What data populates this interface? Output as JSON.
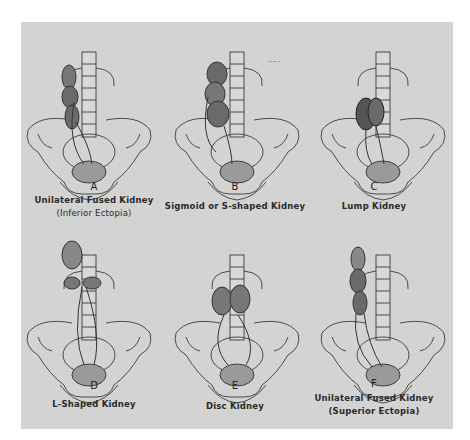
{
  "figure": {
    "background_color": "#d3d3d3",
    "ink_color": "#3a3a3a",
    "kidney_color": "#6a6a6a",
    "panels": [
      {
        "letter": "A",
        "caption_line1": "Unilateral Fused Kidney",
        "caption_line2": "(Inferior Ectopia)"
      },
      {
        "letter": "B",
        "caption_line1": "Sigmoid or S-shaped Kidney",
        "caption_line2": ""
      },
      {
        "letter": "C",
        "caption_line1": "Lump Kidney",
        "caption_line2": ""
      },
      {
        "letter": "D",
        "caption_line1": "L-Shaped Kidney",
        "caption_line2": ""
      },
      {
        "letter": "E",
        "caption_line1": "Disc Kidney",
        "caption_line2": ""
      },
      {
        "letter": "F",
        "caption_line1": "Unilateral Fused Kidney",
        "caption_line2": "(Superior Ectopia)"
      }
    ]
  }
}
